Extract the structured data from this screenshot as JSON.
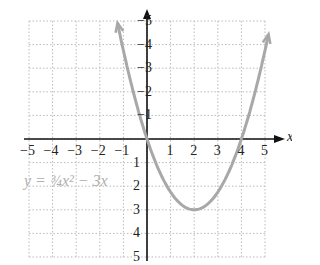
{
  "chart_data": {
    "type": "line",
    "title": "",
    "equation": "y = 3/4 x^2 - 3x",
    "xlabel": "x",
    "ylabel": "",
    "xlim": [
      -5,
      5
    ],
    "ylim": [
      -5,
      5
    ],
    "xticks": [
      -5,
      -4,
      -3,
      -2,
      -1,
      1,
      2,
      3,
      4,
      5
    ],
    "yticks": [
      -5,
      -4,
      -3,
      -2,
      -1,
      1,
      2,
      3,
      4,
      5
    ],
    "grid": true,
    "series": [
      {
        "name": "y = 3/4 x^2 - 3x",
        "x": [
          -1.3,
          -1,
          0,
          1,
          2,
          3,
          4,
          5.2
        ],
        "y": [
          5.17,
          3.75,
          0,
          -2.25,
          -3,
          -2.25,
          0,
          4.68
        ],
        "color": "#a8a8a8"
      }
    ]
  },
  "labels": {
    "axis_x": "x",
    "equation_text": "y = ¾x² − 3x",
    "xticks": [
      "−5",
      "−4",
      "−3",
      "−2",
      "−1",
      "1",
      "2",
      "3",
      "4",
      "5"
    ],
    "yticks": [
      "5",
      "4",
      "3",
      "2",
      "1",
      "−1",
      "−2",
      "−3",
      "−4",
      "−5"
    ]
  }
}
